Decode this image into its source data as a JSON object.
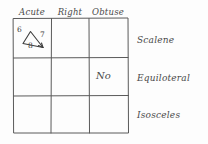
{
  "table": {
    "column_headers": [
      "Acute",
      "Right",
      "Obtuse"
    ],
    "row_labels": [
      "Scalene",
      "Equiloteral",
      "Isosceles"
    ],
    "cells": {
      "acute_scalene": {
        "content_type": "triangle-sketch",
        "side_labels": [
          "6",
          "7",
          "8"
        ]
      },
      "obtuse_equiloteral": {
        "content_type": "text",
        "text": "No"
      }
    }
  },
  "colors": {
    "ink": "#4a4a4a",
    "grid_line": "#5a5a5a",
    "background": "#fdfdfd"
  }
}
